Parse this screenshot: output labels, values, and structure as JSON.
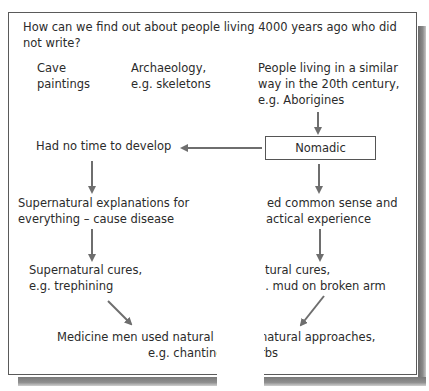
{
  "question": {
    "line1": "How can we find out about people living 4000 years ago who did",
    "line2": "not write?"
  },
  "sources": [
    {
      "line1": "Cave",
      "line2": "paintings"
    },
    {
      "line1": "Archaeology,",
      "line2": "e.g. skeletons"
    },
    {
      "line1": "People living in a similar",
      "line2": "way in the 20th century,",
      "line3": "e.g. Aborigines"
    }
  ],
  "nodes": {
    "nomadic": "Nomadic",
    "no_time": "Had no time to develop",
    "supernatural_explanations": {
      "line1": "Supernatural explanations for",
      "line2": "everything  – cause disease"
    },
    "common_sense": {
      "line1": "ed common sense and",
      "line2": "actical experience"
    },
    "supernatural_cures": {
      "line1": "Supernatural cures,",
      "line2": "e.g. trephining"
    },
    "natural_cures": {
      "line1": "tural cures,",
      "line2": "j. mud on broken arm"
    },
    "medicine_men": {
      "left_line1": "Medicine men used natural ar",
      "left_line2": "e.g. chantinç",
      "right_line1": "natural approaches,",
      "right_line2": "rbs"
    }
  },
  "colors": {
    "arrow": "#6e6e6e",
    "border": "#5a5a5a",
    "text": "#2b2b2b",
    "shadow": "#7a7a7a"
  }
}
